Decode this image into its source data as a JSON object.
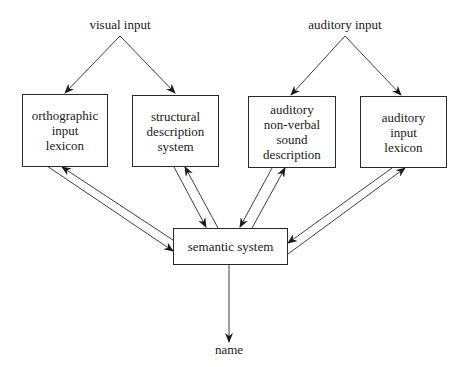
{
  "diagram": {
    "inputs": {
      "visual": "visual input",
      "auditory": "auditory input"
    },
    "boxes": [
      {
        "id": "orthographic-input-lexicon",
        "lines": [
          "orthographic",
          "input",
          "lexicon"
        ]
      },
      {
        "id": "structural-description-system",
        "lines": [
          "structural",
          "description",
          "system"
        ]
      },
      {
        "id": "auditory-non-verbal-sound-description",
        "lines": [
          "auditory",
          "non-verbal",
          "sound",
          "description"
        ]
      },
      {
        "id": "auditory-input-lexicon",
        "lines": [
          "auditory",
          "input",
          "lexicon"
        ]
      }
    ],
    "semantic": "semantic system",
    "output": "name",
    "edges": [
      {
        "from": "visual input",
        "to": "orthographic input lexicon",
        "direction": "one-way"
      },
      {
        "from": "visual input",
        "to": "structural description system",
        "direction": "one-way"
      },
      {
        "from": "auditory input",
        "to": "auditory non-verbal sound description",
        "direction": "one-way"
      },
      {
        "from": "auditory input",
        "to": "auditory input lexicon",
        "direction": "one-way"
      },
      {
        "from": "orthographic input lexicon",
        "to": "semantic system",
        "direction": "bidirectional"
      },
      {
        "from": "structural description system",
        "to": "semantic system",
        "direction": "bidirectional"
      },
      {
        "from": "auditory non-verbal sound description",
        "to": "semantic system",
        "direction": "bidirectional"
      },
      {
        "from": "auditory input lexicon",
        "to": "semantic system",
        "direction": "bidirectional"
      },
      {
        "from": "semantic system",
        "to": "name",
        "direction": "one-way"
      }
    ]
  }
}
